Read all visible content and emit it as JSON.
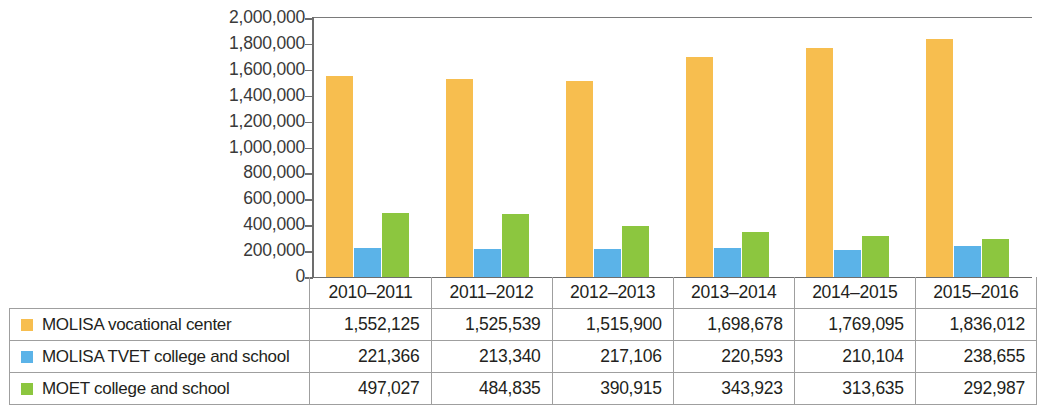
{
  "chart_data": {
    "type": "bar",
    "title": "",
    "xlabel": "",
    "ylabel": "",
    "ylim": [
      0,
      2000000
    ],
    "ytick_step": 200000,
    "ytick_labels": [
      "2,000,000",
      "1,800,000",
      "1,600,000",
      "1,400,000",
      "1,200,000",
      "1,000,000",
      "800,000",
      "600,000",
      "400,000",
      "200,000",
      "0"
    ],
    "ytick_values": [
      2000000,
      1800000,
      1600000,
      1400000,
      1200000,
      1000000,
      800000,
      600000,
      400000,
      200000,
      0
    ],
    "grid": false,
    "legend_position": "table-left-column",
    "categories": [
      "2010–2011",
      "2011–2012",
      "2012–2013",
      "2013–2014",
      "2014–2015",
      "2015–2016"
    ],
    "series": [
      {
        "name": "MOLISA vocational center",
        "color": "#f7be4f",
        "values": [
          1552125,
          1525539,
          1515900,
          1698678,
          1769095,
          1836012
        ],
        "labels": [
          "1,552,125",
          "1,525,539",
          "1,515,900",
          "1,698,678",
          "1,769,095",
          "1,836,012"
        ]
      },
      {
        "name": "MOLISA TVET college and school",
        "color": "#5bb3e8",
        "values": [
          221366,
          213340,
          217106,
          220593,
          210104,
          238655
        ],
        "labels": [
          "221,366",
          "213,340",
          "217,106",
          "220,593",
          "210,104",
          "238,655"
        ]
      },
      {
        "name": "MOET college and school",
        "color": "#8cc63f",
        "values": [
          497027,
          484835,
          390915,
          343923,
          313635,
          292987
        ],
        "labels": [
          "497,027",
          "484,835",
          "390,915",
          "343,923",
          "313,635",
          "292,987"
        ]
      }
    ]
  },
  "colors": {
    "series_orange": "#f7be4f",
    "series_blue": "#5bb3e8",
    "series_green": "#8cc63f",
    "axis": "#6d6d6d",
    "table_border": "#9f9f9f",
    "text": "#231f20",
    "background": "#ffffff"
  }
}
